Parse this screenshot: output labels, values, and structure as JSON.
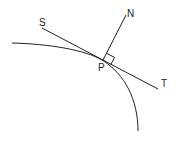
{
  "diagram": {
    "labels": {
      "S": "S",
      "N": "N",
      "P": "P",
      "T": "T"
    },
    "elements": [
      {
        "type": "curve",
        "description": "convex curve passing through P"
      },
      {
        "type": "line",
        "name": "tangent",
        "from": "S",
        "to": "T",
        "through": "P"
      },
      {
        "type": "line",
        "name": "normal",
        "from": "P",
        "to": "N"
      },
      {
        "type": "right-angle-marker",
        "at": "P"
      }
    ],
    "stroke_color": "#222222"
  }
}
